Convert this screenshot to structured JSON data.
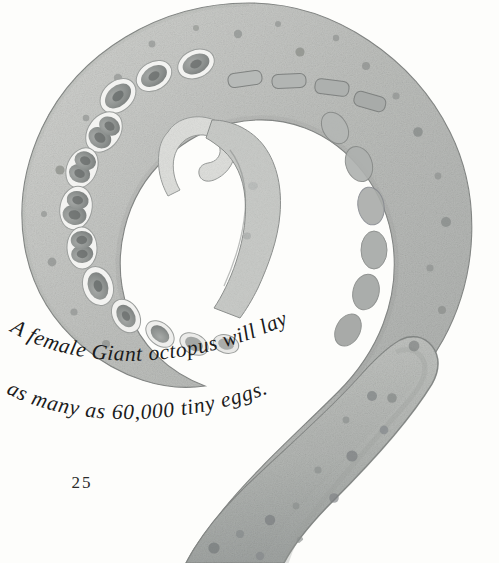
{
  "page": {
    "kind": "illustrated-book-page",
    "page_number": "25",
    "background_color": "#fdfdfb"
  },
  "caption": {
    "line1": "A female Giant octopus will lay",
    "line2": "as many as 60,000 tiny eggs.",
    "full_text": "A female Giant octopus will lay as many as 60,000 tiny eggs.",
    "text_color": "#1b1b1b",
    "style": "italic serif, curved baseline"
  },
  "illustration": {
    "subject": "giant-octopus-tentacle",
    "description": "A watercolor giant octopus arm curled into a spiral, with two rows of suckers along the inner edge and a tapering tip curled in the center.",
    "medium": "watercolor",
    "colors": {
      "arm_light": "#cfd0cd",
      "arm_mid": "#b5b7b4",
      "arm_dark": "#9a9d9a",
      "outline": "#7b7e7c",
      "spot": "#8c8f8d",
      "spot_dark": "#75797a",
      "sucker_rim": "#f2f2f0",
      "sucker_fill": "#9fa2a0",
      "sucker_core": "#6f7372",
      "tip_light": "#dedfdc"
    },
    "parts": [
      {
        "name": "outer-arm-spiral",
        "label": "Outer arm coil"
      },
      {
        "name": "lower-arm-taper",
        "label": "Lower tapering arm"
      },
      {
        "name": "sucker-row",
        "label": "Row of suckers"
      },
      {
        "name": "arm-tip-curl",
        "label": "Curled arm tip"
      },
      {
        "name": "skin-spots",
        "label": "Skin spots"
      }
    ]
  }
}
